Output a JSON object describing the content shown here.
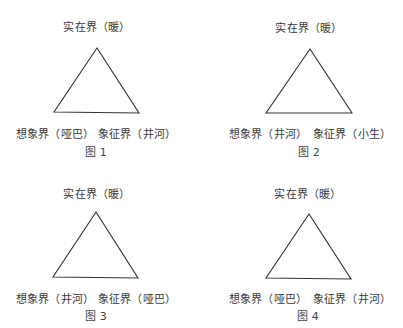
{
  "figures": [
    {
      "caption": "图 1",
      "top_label": "实在界（暖）",
      "left_label": "想象界（哑巴）",
      "right_label": "象征界（井河）",
      "vertices": {
        "apex": [
          97,
          48
        ],
        "left": [
          54,
          112
        ],
        "right": [
          139,
          113
        ]
      }
    },
    {
      "caption": "图 2",
      "top_label": "实在界（暖）",
      "left_label": "想象界（井河）",
      "right_label": "象征界（小生）",
      "vertices": {
        "apex": [
          110,
          49
        ],
        "left": [
          66,
          113
        ],
        "right": [
          152,
          113
        ]
      }
    },
    {
      "caption": "图 3",
      "top_label": "实在界（暖）",
      "left_label": "想象界（井河）",
      "right_label": "象征界（哑巴）",
      "vertices": {
        "apex": [
          96,
          48
        ],
        "left": [
          53,
          113
        ],
        "right": [
          138,
          114
        ]
      }
    },
    {
      "caption": "图 4",
      "top_label": "实在界（暖）",
      "left_label": "想象界（哑巴）",
      "right_label": "象征界（井河）",
      "vertices": {
        "apex": [
          109,
          50
        ],
        "left": [
          66,
          114
        ],
        "right": [
          151,
          115
        ]
      }
    }
  ],
  "colors": {
    "line": "#333333",
    "text": "#3a3a3a",
    "background": "#ffffff"
  }
}
